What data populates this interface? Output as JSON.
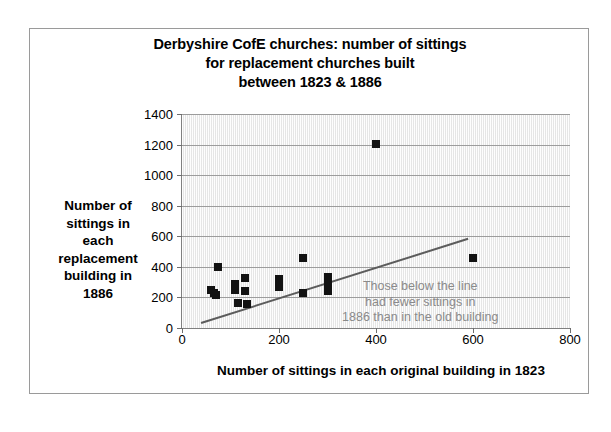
{
  "chart_data": {
    "type": "scatter",
    "title": "Derbyshire CofE churches: number of sittings for replacement churches built between 1823 & 1886",
    "title_lines": [
      "Derbyshire CofE churches: number of sittings",
      "for replacement churches built",
      "between 1823 & 1886"
    ],
    "xlabel": "Number of sittings in each original building in 1823",
    "ylabel": "Number of sittings in each replacement building in 1886",
    "ylabel_lines": [
      "Number of",
      "sittings in",
      "each",
      "replacement",
      "building in",
      "1886"
    ],
    "xlim": [
      0,
      800
    ],
    "ylim": [
      0,
      1400
    ],
    "xticks": [
      0,
      200,
      400,
      600,
      800
    ],
    "yticks": [
      0,
      200,
      400,
      600,
      800,
      1000,
      1200,
      1400
    ],
    "grid": "horizontal",
    "legend": "none",
    "plot_background": "#f2f2f2",
    "marker_color": "#121212",
    "marker_shape": "square",
    "points": [
      {
        "x": 75,
        "y": 400
      },
      {
        "x": 60,
        "y": 250
      },
      {
        "x": 65,
        "y": 230
      },
      {
        "x": 70,
        "y": 215
      },
      {
        "x": 110,
        "y": 290
      },
      {
        "x": 110,
        "y": 250
      },
      {
        "x": 115,
        "y": 165
      },
      {
        "x": 130,
        "y": 330
      },
      {
        "x": 130,
        "y": 245
      },
      {
        "x": 135,
        "y": 160
      },
      {
        "x": 200,
        "y": 320
      },
      {
        "x": 200,
        "y": 270
      },
      {
        "x": 250,
        "y": 455
      },
      {
        "x": 250,
        "y": 230
      },
      {
        "x": 300,
        "y": 335
      },
      {
        "x": 300,
        "y": 285
      },
      {
        "x": 300,
        "y": 240
      },
      {
        "x": 400,
        "y": 1205
      },
      {
        "x": 600,
        "y": 455
      }
    ],
    "trend_line": {
      "label": "y = x reference line",
      "color": "#5c5c5c",
      "x_start": 40,
      "y_start": 40,
      "x_end": 590,
      "y_end": 590
    },
    "annotation": {
      "text": "Those below the line had fewer sittings in 1886 than in the old building",
      "lines": [
        "Those below the line",
        "had fewer sittings in",
        "1886 than in the old building"
      ],
      "color": "#8a8a8a"
    }
  }
}
